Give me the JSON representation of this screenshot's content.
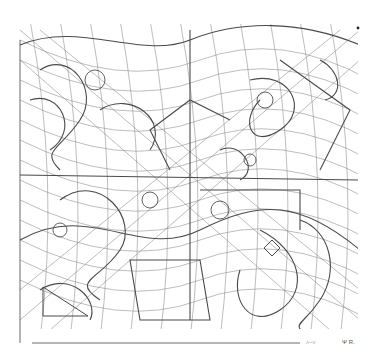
{
  "artwork": {
    "description": "Abstract pen-and-ink line drawing: dense tangle of flowing curves, grid meshes, and geometric shapes within a rectangular border",
    "colors": {
      "background": "#ffffff",
      "ink": "#2b2b2b",
      "light_ink": "#6a6a6a"
    },
    "signature": "Ψ R.",
    "faint_text": "ʌ~v"
  }
}
